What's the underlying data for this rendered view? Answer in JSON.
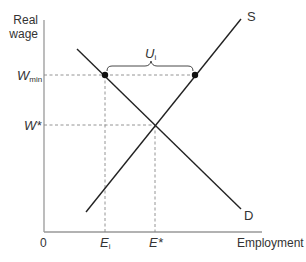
{
  "diagram": {
    "y_axis_label_line1": "Real",
    "y_axis_label_line2": "wage",
    "x_axis_label": "Employment",
    "origin_label": "0",
    "wmin_label": "W",
    "wmin_sub": "min",
    "wstar_label": "W*",
    "ei_label": "E",
    "ei_sub": "i",
    "estar_label": "E*",
    "ui_label": "U",
    "ui_sub": "i",
    "supply_label": "S",
    "demand_label": "D",
    "colors": {
      "axis": "#999999",
      "curve": "#222222",
      "guide": "#888888",
      "text": "#333333"
    }
  }
}
